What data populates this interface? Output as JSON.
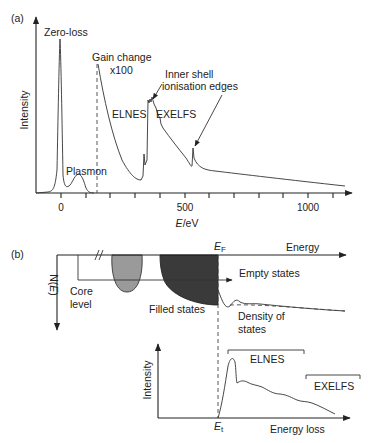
{
  "panel_a": {
    "label": "(a)",
    "y_axis_label": "Intensity",
    "x_axis_label_italic": "E",
    "x_axis_label_unit": "/eV",
    "tick_labels": [
      "0",
      "500",
      "1000"
    ],
    "tick_values": [
      0,
      100,
      200,
      300,
      400,
      500,
      600,
      700,
      800,
      900,
      1000,
      1100
    ],
    "annotations": {
      "zero_loss": "Zero-loss",
      "plasmon": "Plasmon",
      "gain_change_line1": "Gain change",
      "gain_change_line2": "x100",
      "elnes": "ELNES",
      "exelfs": "EXELFS",
      "inner_shell_line1": "Inner shell",
      "inner_shell_line2": "ionisation edges"
    }
  },
  "panel_b": {
    "label": "(b)",
    "energy_axis_label": "Energy",
    "fermi_label_main": "E",
    "fermi_label_sub": "F",
    "dos_axis_label_main": "N(",
    "dos_axis_label_italic": "E",
    "dos_axis_label_end": ")",
    "core_level_line1": "Core",
    "core_level_line2": "level",
    "empty_states": "Empty states",
    "filled_states": "Filled states",
    "dos_line1": "Density of",
    "dos_line2": "states",
    "lower_graph": {
      "y_axis_label": "Intensity",
      "x_axis_label": "Energy loss",
      "threshold_main": "E",
      "threshold_sub": "t",
      "elnes": "ELNES",
      "exelfs": "EXELFS"
    }
  },
  "colors": {
    "line": "#222222",
    "core_lobe_fill": "#9a9a9a",
    "filled_states_fill": "#3a3a3a",
    "background": "#ffffff"
  }
}
